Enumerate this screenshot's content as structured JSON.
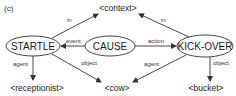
{
  "panel_label": "(c)",
  "nodes": {
    "startle": {
      "label": "STARTLE",
      "cx": 33,
      "cy": 46,
      "rx": 27,
      "ry": 10
    },
    "cause": {
      "label": "CAUSE",
      "cx": 110,
      "cy": 46,
      "rx": 25,
      "ry": 10
    },
    "kickover": {
      "label": "KICK-OVER",
      "cx": 205,
      "cy": 46,
      "rx": 28,
      "ry": 11
    }
  },
  "terminals": {
    "context": {
      "label": "<context>",
      "x": 118,
      "y": 10
    },
    "receptionist": {
      "label": "<receptionist>",
      "x": 37,
      "y": 91
    },
    "cow": {
      "label": "<cow>",
      "x": 117,
      "y": 91
    },
    "bucket": {
      "label": "<bucket>",
      "x": 206,
      "y": 91
    }
  },
  "edges": [
    {
      "from": "STARTLE",
      "to": "<context>",
      "label": "in"
    },
    {
      "from": "KICK-OVER",
      "to": "<context>",
      "label": "in"
    },
    {
      "from": "CAUSE",
      "to": "STARTLE",
      "label": "event"
    },
    {
      "from": "CAUSE",
      "to": "KICK-OVER",
      "label": "action"
    },
    {
      "from": "STARTLE",
      "to": "<receptionist>",
      "label": "agent"
    },
    {
      "from": "STARTLE",
      "to": "<cow>",
      "label": "object"
    },
    {
      "from": "KICK-OVER",
      "to": "<cow>",
      "label": "agent"
    },
    {
      "from": "KICK-OVER",
      "to": "<bucket>",
      "label": "object"
    }
  ],
  "colors": {
    "stroke": "#333333",
    "text": "#1a1a1a",
    "background": "#ffffff"
  }
}
